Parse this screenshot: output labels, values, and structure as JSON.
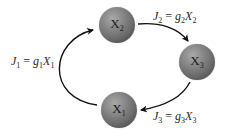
{
  "diagram": {
    "type": "cycle",
    "nodes": [
      {
        "id": "X2",
        "symbol": "X",
        "subscript": "2",
        "position": "top",
        "center": [
          117,
          25
        ]
      },
      {
        "id": "X3",
        "symbol": "X",
        "subscript": "3",
        "position": "right",
        "center": [
          197,
          62
        ]
      },
      {
        "id": "X1",
        "symbol": "X",
        "subscript": "1",
        "position": "bottom",
        "center": [
          119,
          110
        ]
      }
    ],
    "edges": [
      {
        "from": "X1",
        "to": "X2",
        "label": {
          "flux": "J",
          "flux_sub": "1",
          "rate": "g",
          "rate_sub": "1",
          "var": "X",
          "var_sub": "1",
          "eq": "="
        }
      },
      {
        "from": "X2",
        "to": "X3",
        "label": {
          "flux": "J",
          "flux_sub": "2",
          "rate": "g",
          "rate_sub": "2",
          "var": "X",
          "var_sub": "2",
          "eq": "="
        }
      },
      {
        "from": "X3",
        "to": "X1",
        "label": {
          "flux": "J",
          "flux_sub": "3",
          "rate": "g",
          "rate_sub": "3",
          "var": "X",
          "var_sub": "3",
          "eq": "="
        }
      }
    ],
    "colors": {
      "node_fill_light": "#a9a9a9",
      "node_fill_dark": "#3c3c3c",
      "arrow": "#111111",
      "text": "#2a2a2a"
    }
  }
}
